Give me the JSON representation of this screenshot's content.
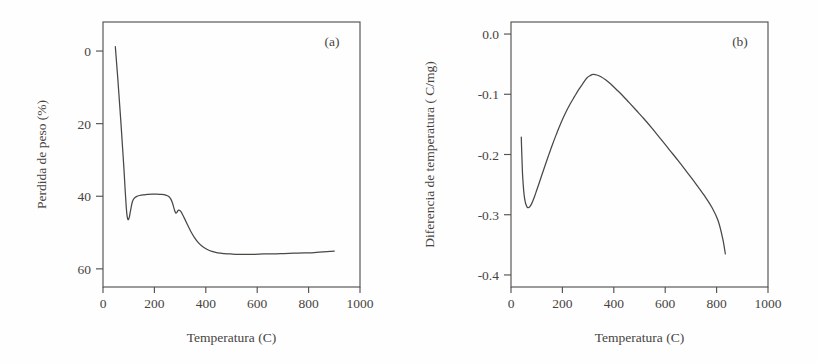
{
  "figure": {
    "panel_count": 2,
    "background_color": "#fefefe",
    "line_color": "#4a4745",
    "axis_color": "#55524f",
    "text_color": "#47443f"
  },
  "chart_data": [
    {
      "type": "line",
      "panel_label": "(a)",
      "title": "",
      "xlabel": "Temperatura (C)",
      "ylabel": "Perdida de peso (%)",
      "xlim": [
        0,
        1000
      ],
      "ylim": [
        65,
        -8
      ],
      "y_inverted": true,
      "grid": false,
      "legend": "none",
      "xticks": [
        0,
        200,
        400,
        600,
        800,
        1000
      ],
      "xticklabels": [
        "0",
        "200",
        "400",
        "600",
        "800",
        "1000"
      ],
      "yticks": [
        0,
        20,
        40,
        60
      ],
      "yticklabels": [
        "0",
        "20",
        "40",
        "60"
      ],
      "series": [
        {
          "name": "TGA",
          "x": [
            48,
            52,
            58,
            64,
            70,
            76,
            82,
            86,
            90,
            93,
            96,
            99,
            103,
            108,
            114,
            121,
            130,
            142,
            156,
            172,
            190,
            210,
            228,
            244,
            256,
            264,
            270,
            275,
            279,
            283,
            287,
            291,
            295,
            299,
            304,
            310,
            317,
            325,
            334,
            344,
            356,
            370,
            386,
            404,
            424,
            446,
            470,
            496,
            524,
            556,
            590,
            626,
            664,
            704,
            744,
            784,
            822,
            856,
            884,
            900
          ],
          "y": [
            -1.2,
            2.5,
            8.0,
            14.0,
            20.0,
            26.5,
            33.0,
            38.0,
            42.5,
            45.0,
            46.2,
            46.4,
            45.6,
            43.6,
            41.6,
            40.6,
            40.1,
            39.8,
            39.6,
            39.5,
            39.4,
            39.4,
            39.5,
            39.7,
            40.1,
            40.8,
            41.8,
            43.0,
            44.0,
            44.6,
            44.5,
            44.0,
            43.8,
            43.9,
            44.3,
            45.1,
            46.1,
            47.3,
            48.6,
            50.0,
            51.4,
            52.7,
            53.8,
            54.6,
            55.2,
            55.6,
            55.8,
            55.9,
            56.0,
            56.0,
            56.0,
            55.9,
            55.9,
            55.8,
            55.7,
            55.6,
            55.5,
            55.3,
            55.2,
            55.1
          ]
        }
      ]
    },
    {
      "type": "line",
      "panel_label": "(b)",
      "title": "",
      "xlabel": "Temperatura (C)",
      "ylabel": "Diferencia de temperatura ( C/mg)",
      "xlim": [
        0,
        1000
      ],
      "ylim": [
        -0.42,
        0.02
      ],
      "y_inverted": false,
      "grid": false,
      "legend": "none",
      "xticks": [
        0,
        200,
        400,
        600,
        800,
        1000
      ],
      "xticklabels": [
        "0",
        "200",
        "400",
        "600",
        "800",
        "1000"
      ],
      "yticks": [
        0.0,
        -0.1,
        -0.2,
        -0.3,
        -0.4
      ],
      "yticklabels": [
        "0.0",
        "-0.1",
        "-0.2",
        "-0.3",
        "-0.4"
      ],
      "series": [
        {
          "name": "DTA",
          "x": [
            40,
            41,
            43,
            45,
            48,
            51,
            55,
            59,
            64,
            69,
            74,
            80,
            86,
            93,
            101,
            110,
            120,
            132,
            145,
            160,
            176,
            193,
            211,
            229,
            247,
            264,
            280,
            295,
            308,
            320,
            334,
            350,
            368,
            388,
            410,
            434,
            460,
            488,
            518,
            550,
            584,
            618,
            652,
            686,
            720,
            752,
            782,
            806,
            824,
            834
          ],
          "y": [
            -0.171,
            -0.186,
            -0.211,
            -0.233,
            -0.253,
            -0.267,
            -0.278,
            -0.284,
            -0.288,
            -0.288,
            -0.286,
            -0.282,
            -0.276,
            -0.268,
            -0.258,
            -0.247,
            -0.234,
            -0.219,
            -0.203,
            -0.185,
            -0.167,
            -0.149,
            -0.132,
            -0.117,
            -0.104,
            -0.092,
            -0.082,
            -0.073,
            -0.069,
            -0.067,
            -0.068,
            -0.071,
            -0.076,
            -0.083,
            -0.092,
            -0.102,
            -0.114,
            -0.127,
            -0.141,
            -0.157,
            -0.175,
            -0.193,
            -0.211,
            -0.23,
            -0.249,
            -0.268,
            -0.288,
            -0.31,
            -0.34,
            -0.365
          ]
        }
      ]
    }
  ]
}
